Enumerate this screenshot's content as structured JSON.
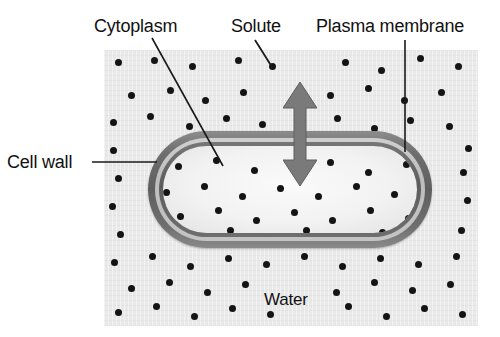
{
  "figure": {
    "type": "biology-diagram",
    "width": 500,
    "height": 337
  },
  "labels": {
    "cytoplasm": "Cytoplasm",
    "solute": "Solute",
    "plasma_membrane": "Plasma membrane",
    "cell_wall": "Cell wall",
    "water": "Water"
  },
  "colors": {
    "background": "#ffffff",
    "solution_panel": "#e9e9e9",
    "cell_wall": "#5f5f5f",
    "cell_wall_inner": "#c4c4c4",
    "plasma_membrane": "#5d5d5d",
    "cytoplasm": "#f2f2f2",
    "solute_dot": "#141414",
    "arrow": "#7a7a7a",
    "text": "#111111",
    "leader_line": "#1a1a1a"
  },
  "leader_lines": [
    {
      "name": "cytoplasm-leader",
      "x1": 152,
      "y1": 38,
      "x2": 223,
      "y2": 166
    },
    {
      "name": "solute-leader",
      "x1": 255,
      "y1": 40,
      "x2": 272,
      "y2": 67
    },
    {
      "name": "plasma-leader",
      "x1": 405,
      "y1": 40,
      "x2": 405,
      "y2": 152
    },
    {
      "name": "cellwall-leader",
      "x1": 92,
      "y1": 162,
      "x2": 157,
      "y2": 162
    }
  ],
  "cell": {
    "x": 148,
    "y": 131,
    "width": 284,
    "height": 117,
    "corner_radius": 60,
    "wall_thickness": 7,
    "membrane_thickness": 4
  },
  "arrow": {
    "name": "osmosis-arrow",
    "direction": "bidirectional-vertical",
    "x": 283,
    "y": 82,
    "width": 34,
    "height": 104,
    "meaning": "water moves in both directions across the plasma membrane"
  },
  "solute_dots_outside": [
    [
      118,
      62
    ],
    [
      154,
      60
    ],
    [
      192,
      66
    ],
    [
      238,
      60
    ],
    [
      272,
      66
    ],
    [
      345,
      62
    ],
    [
      381,
      70
    ],
    [
      420,
      58
    ],
    [
      458,
      66
    ],
    [
      131,
      95
    ],
    [
      170,
      90
    ],
    [
      205,
      100
    ],
    [
      243,
      92
    ],
    [
      330,
      95
    ],
    [
      368,
      88
    ],
    [
      404,
      100
    ],
    [
      441,
      92
    ],
    [
      113,
      122
    ],
    [
      150,
      116
    ],
    [
      189,
      126
    ],
    [
      226,
      118
    ],
    [
      262,
      124
    ],
    [
      337,
      118
    ],
    [
      374,
      128
    ],
    [
      410,
      120
    ],
    [
      449,
      126
    ],
    [
      113,
      150
    ],
    [
      468,
      148
    ],
    [
      118,
      178
    ],
    [
      463,
      172
    ],
    [
      112,
      206
    ],
    [
      467,
      200
    ],
    [
      120,
      234
    ],
    [
      461,
      230
    ],
    [
      114,
      262
    ],
    [
      152,
      256
    ],
    [
      190,
      266
    ],
    [
      228,
      258
    ],
    [
      266,
      264
    ],
    [
      304,
      256
    ],
    [
      342,
      266
    ],
    [
      380,
      258
    ],
    [
      418,
      264
    ],
    [
      456,
      256
    ],
    [
      131,
      288
    ],
    [
      169,
      282
    ],
    [
      207,
      292
    ],
    [
      245,
      284
    ],
    [
      336,
      292
    ],
    [
      374,
      282
    ],
    [
      412,
      290
    ],
    [
      450,
      284
    ],
    [
      118,
      312
    ],
    [
      156,
      306
    ],
    [
      194,
      316
    ],
    [
      232,
      308
    ],
    [
      270,
      314
    ],
    [
      348,
      306
    ],
    [
      386,
      316
    ],
    [
      424,
      308
    ],
    [
      462,
      314
    ]
  ],
  "solute_dots_inside": [
    [
      178,
      166
    ],
    [
      216,
      160
    ],
    [
      254,
      170
    ],
    [
      330,
      162
    ],
    [
      368,
      172
    ],
    [
      406,
      164
    ],
    [
      166,
      192
    ],
    [
      204,
      186
    ],
    [
      242,
      196
    ],
    [
      280,
      188
    ],
    [
      318,
      196
    ],
    [
      356,
      186
    ],
    [
      394,
      194
    ],
    [
      180,
      216
    ],
    [
      218,
      210
    ],
    [
      256,
      220
    ],
    [
      294,
      212
    ],
    [
      332,
      220
    ],
    [
      370,
      210
    ],
    [
      408,
      218
    ],
    [
      192,
      236
    ],
    [
      230,
      230
    ],
    [
      268,
      238
    ],
    [
      306,
      230
    ],
    [
      344,
      238
    ],
    [
      382,
      232
    ]
  ]
}
